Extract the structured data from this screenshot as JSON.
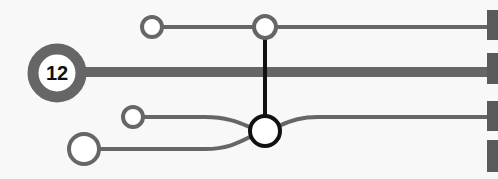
{
  "diagram": {
    "type": "transit-line-diagram",
    "hub_label": "12",
    "colors": {
      "line": "#666666",
      "connector": "#111111",
      "background": "#f8f8f8",
      "terminal": "#5a5a5a"
    },
    "lines": [
      {
        "name": "top-line",
        "y": 27,
        "stations": 2
      },
      {
        "name": "main-line",
        "y": 72,
        "hub": "12"
      },
      {
        "name": "branch-upper",
        "y": 117
      },
      {
        "name": "branch-lower",
        "y": 149
      }
    ],
    "terminals": 4
  }
}
